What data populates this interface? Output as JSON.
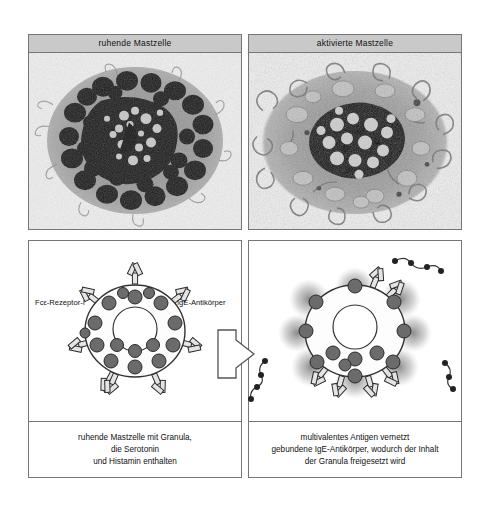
{
  "figure": {
    "columns": [
      {
        "id": "resting",
        "micrograph": {
          "header": "ruhende Mastzelle",
          "alt_name": "electron-micrograph-resting-mast-cell"
        },
        "diagram": {
          "name": "schematic-resting-mast-cell",
          "labels": {
            "receptor": "Fcε-Rezeptor-I",
            "antibody": "IgE-Antikörper"
          },
          "caption_lines": [
            "ruhende Mastzelle mit Granula,",
            "die Serotonin",
            "und Histamin enthalten"
          ]
        }
      },
      {
        "id": "activated",
        "micrograph": {
          "header": "aktivierte Mastzelle",
          "alt_name": "electron-micrograph-activated-mast-cell"
        },
        "diagram": {
          "name": "schematic-activated-mast-cell",
          "labels": {},
          "caption_lines": [
            "multivalentes Antigen vernetzt",
            "gebundene IgE-Antikörper, wodurch der Inhalt",
            "der Granula freigesetzt wird"
          ]
        }
      }
    ],
    "transition_arrow": {
      "name": "activation-arrow",
      "direction": "right"
    },
    "colors": {
      "header_bg": "#c9c9c9",
      "border": "#767676",
      "granule_fill": "#6b6b6b",
      "granule_stroke": "#2a2a2a",
      "cell_fill": "#fdfdfd",
      "cell_stroke": "#333333",
      "antibody_fill": "#e4e4e4",
      "antibody_stroke": "#2b2b2b",
      "antigen_dot": "#222222",
      "release_halo": "#8a8a8a",
      "micrograph_bg": "#efefef",
      "text": "#111111"
    },
    "schematic_counts": {
      "resting_granules_inside": 16,
      "resting_receptors": 7,
      "activated_granules_fused": 8,
      "activated_granules_inside": 4,
      "activated_antigen_chains": 3
    }
  }
}
